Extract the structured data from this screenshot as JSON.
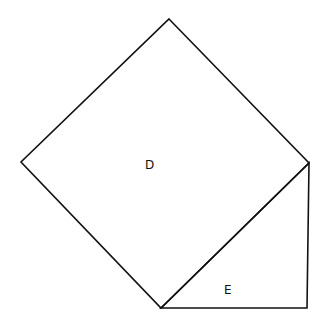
{
  "diagram": {
    "type": "geometry",
    "stroke_color": "#111111",
    "background": "#ffffff",
    "shapes": [
      {
        "id": "D",
        "kind": "square",
        "label": "D",
        "points": [
          [
            169,
            19
          ],
          [
            309,
            163
          ],
          [
            161,
            308
          ],
          [
            21,
            162
          ]
        ],
        "label_pos": [
          145,
          159
        ]
      },
      {
        "id": "E",
        "kind": "right-triangle",
        "label": "E",
        "points": [
          [
            161,
            308
          ],
          [
            309,
            163
          ],
          [
            307,
            308
          ]
        ],
        "label_pos": [
          224,
          284
        ]
      }
    ]
  }
}
